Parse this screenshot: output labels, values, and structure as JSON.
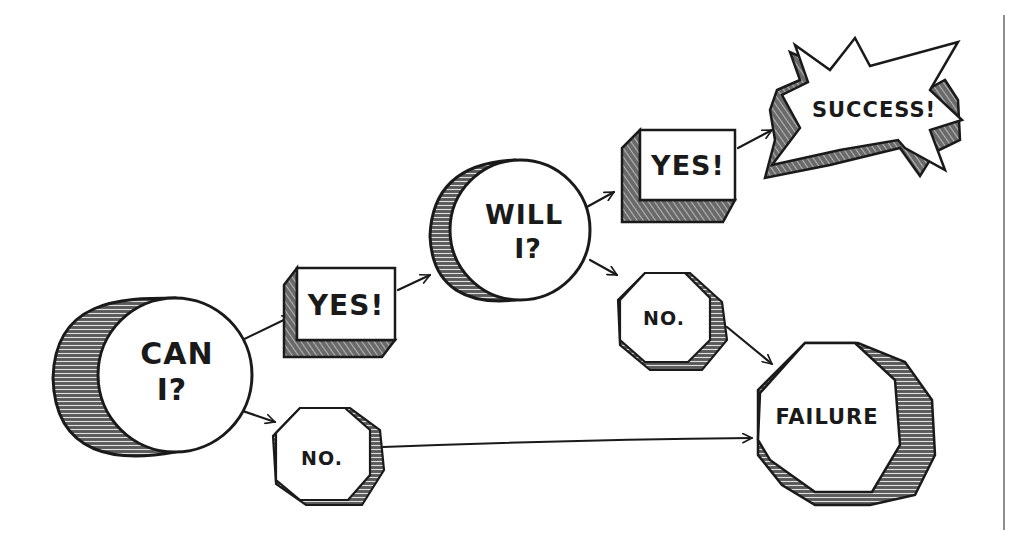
{
  "diagram": {
    "type": "decision-flowchart",
    "style": "hand-drawn sketch, black ink on white, 3D shaded shapes",
    "colors": {
      "ink": "#1a1a1a",
      "shade": "#555555",
      "background": "#ffffff"
    },
    "nodes": {
      "can_i": {
        "shape": "cylinder",
        "line1": "CAN",
        "line2": "I?"
      },
      "yes_1": {
        "shape": "box",
        "label": "YES!"
      },
      "no_1": {
        "shape": "octagon",
        "label": "NO."
      },
      "will_i": {
        "shape": "cylinder",
        "line1": "WILL",
        "line2": "I?"
      },
      "yes_2": {
        "shape": "box",
        "label": "YES!"
      },
      "no_2": {
        "shape": "octagon",
        "label": "NO."
      },
      "success": {
        "shape": "starburst",
        "label": "SUCCESS!"
      },
      "failure": {
        "shape": "octagon",
        "label": "FAILURE"
      }
    },
    "edges": [
      {
        "from": "can_i",
        "to": "yes_1"
      },
      {
        "from": "can_i",
        "to": "no_1"
      },
      {
        "from": "yes_1",
        "to": "will_i"
      },
      {
        "from": "will_i",
        "to": "yes_2"
      },
      {
        "from": "will_i",
        "to": "no_2"
      },
      {
        "from": "yes_2",
        "to": "success"
      },
      {
        "from": "no_2",
        "to": "failure"
      },
      {
        "from": "no_1",
        "to": "failure"
      }
    ]
  }
}
